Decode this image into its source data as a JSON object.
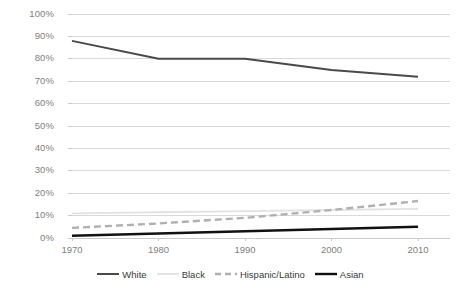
{
  "chart_data": {
    "type": "line",
    "title": "",
    "xlabel": "",
    "ylabel": "",
    "x": [
      1970,
      1980,
      1990,
      2000,
      2010
    ],
    "categories": [
      "1970",
      "1980",
      "1990",
      "2000",
      "2010"
    ],
    "ylim": [
      0,
      100
    ],
    "xlim": [
      1970,
      2010
    ],
    "ytick_labels": [
      "100%",
      "90%",
      "80%",
      "70%",
      "60%",
      "50%",
      "40%",
      "30%",
      "20%",
      "10%",
      "0%"
    ],
    "ytick_values": [
      100,
      90,
      80,
      70,
      60,
      50,
      40,
      30,
      20,
      10,
      0
    ],
    "grid": "horizontal",
    "legend_position": "bottom",
    "series": [
      {
        "name": "White",
        "values": [
          88,
          80,
          80,
          75,
          72
        ],
        "color": "#4a4a4a",
        "style": "solid",
        "width": 2.0
      },
      {
        "name": "Black",
        "values": [
          11,
          11.5,
          12,
          12.5,
          13
        ],
        "color": "#e2e2e2",
        "style": "solid",
        "width": 1.8
      },
      {
        "name": "Hispanic/Latino",
        "values": [
          4.5,
          6.5,
          9,
          12.5,
          16.5
        ],
        "color": "#b0b0b0",
        "style": "dashed",
        "width": 2.4
      },
      {
        "name": "Asian",
        "values": [
          1,
          2,
          3,
          4,
          5
        ],
        "color": "#111111",
        "style": "solid",
        "width": 2.4
      }
    ]
  },
  "axis": {
    "y_labels": [
      "100%",
      "90%",
      "80%",
      "70%",
      "60%",
      "50%",
      "40%",
      "30%",
      "20%",
      "10%",
      "0%"
    ],
    "x_labels": [
      "1970",
      "1980",
      "1990",
      "2000",
      "2010"
    ]
  },
  "legend": {
    "items": [
      {
        "label": "White"
      },
      {
        "label": "Black"
      },
      {
        "label": "Hispanic/Latino"
      },
      {
        "label": "Asian"
      }
    ]
  },
  "colors": {
    "gridline": "#d9d9d9",
    "axis_line": "#c8c8c8",
    "tick_text": "#808080",
    "legend_text": "#3a3a3a",
    "background": "#ffffff"
  }
}
